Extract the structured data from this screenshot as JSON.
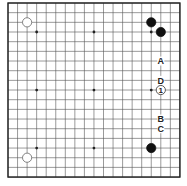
{
  "diagram": {
    "type": "go-board",
    "size": 19,
    "origin": {
      "x": 8,
      "y": 3
    },
    "spacing": {
      "x": 9.55,
      "y": 9.67
    },
    "line_color": "#555555",
    "border_color": "#222222",
    "hoshi": [
      [
        3,
        3
      ],
      [
        3,
        9
      ],
      [
        3,
        15
      ],
      [
        9,
        3
      ],
      [
        9,
        9
      ],
      [
        9,
        15
      ],
      [
        15,
        3
      ],
      [
        15,
        9
      ],
      [
        15,
        15
      ]
    ],
    "stones": [
      {
        "color": "white",
        "col": 2,
        "row": 2
      },
      {
        "color": "white",
        "col": 2,
        "row": 16
      },
      {
        "color": "black",
        "col": 15,
        "row": 2
      },
      {
        "color": "black",
        "col": 16,
        "row": 3
      },
      {
        "color": "black",
        "col": 15,
        "row": 15
      }
    ],
    "labels": [
      {
        "text": "A",
        "col": 16,
        "row": 6
      },
      {
        "text": "D",
        "col": 16,
        "row": 8
      },
      {
        "text": "B",
        "col": 16,
        "row": 12
      },
      {
        "text": "C",
        "col": 16,
        "row": 13
      }
    ],
    "numbered": [
      {
        "text": "1",
        "color": "white",
        "col": 16,
        "row": 9
      }
    ]
  }
}
